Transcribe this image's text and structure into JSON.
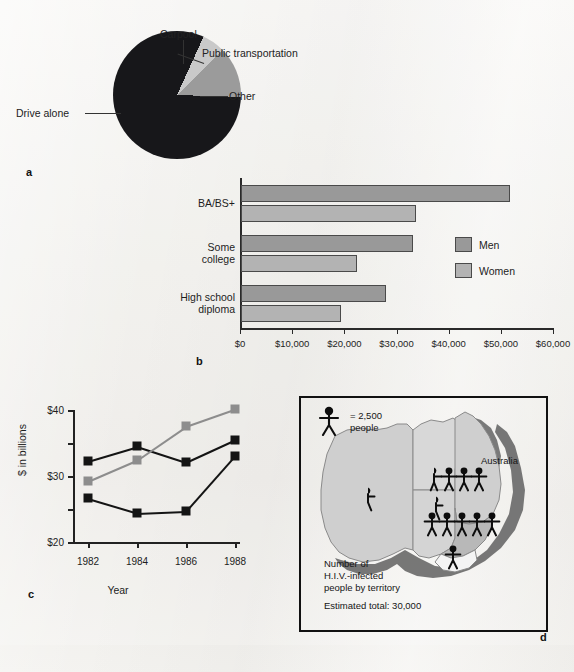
{
  "figure": {
    "background_color": "#f0efec",
    "panels": [
      "a",
      "b",
      "c",
      "d"
    ]
  },
  "panel_a": {
    "letter": "a",
    "labels": {
      "drive_alone": "Drive alone",
      "carpool": "Carpool",
      "public_transportation": "Public transportation",
      "other": "Other"
    }
  },
  "panel_b": {
    "letter": "b",
    "legend": {
      "men": "Men",
      "women": "Women"
    }
  },
  "panel_c": {
    "letter": "c",
    "ylabel": "$ in billions",
    "xlabel": "Year"
  },
  "panel_d": {
    "letter": "d",
    "key_symbol_value": "= 2,500",
    "key_symbol_unit": "people",
    "country": "Australia",
    "caption_line1": "Number of",
    "caption_line2": "H.I.V.-infected",
    "caption_line3": "people by territory",
    "total": "Estimated total: 30,000",
    "territory_counts": [
      {
        "territory": "Western Australia",
        "figures": 0.5,
        "people": 1250
      },
      {
        "territory": "South Australia",
        "figures": 0.5,
        "people": 1250
      },
      {
        "territory": "Queensland",
        "figures": 3.5,
        "people": 8750
      },
      {
        "territory": "New South Wales",
        "figures": 5,
        "people": 12500
      },
      {
        "territory": "Victoria",
        "figures": 1,
        "people": 2500
      }
    ]
  },
  "chart_data": [
    {
      "type": "pie",
      "title": "",
      "panel": "a",
      "labels": [
        "Drive alone",
        "Carpool",
        "Public transportation",
        "Other"
      ],
      "values": [
        73.3,
        6.7,
        5.6,
        12.8
      ],
      "unit": "percent",
      "colors": [
        "#17171a",
        "#17171a",
        "#c9c9c9",
        "#9b9b9b"
      ],
      "legend": "callout-labels"
    },
    {
      "type": "bar",
      "panel": "b",
      "orientation": "horizontal",
      "categories": [
        "BA/BS+",
        "Some college",
        "High school diploma"
      ],
      "series": [
        {
          "name": "Men",
          "values": [
            51500,
            33000,
            27800
          ],
          "color": "#999999"
        },
        {
          "name": "Women",
          "values": [
            33500,
            22300,
            19200
          ],
          "color": "#b3b3b3"
        }
      ],
      "xlabel": "",
      "ylabel": "",
      "xlim": [
        0,
        60000
      ],
      "xticks": [
        0,
        10000,
        20000,
        30000,
        40000,
        50000,
        60000
      ],
      "xticklabels": [
        "$0",
        "$10,000",
        "$20,000",
        "$30,000",
        "$40,000",
        "$50,000",
        "$60,000"
      ],
      "grid": false,
      "legend_position": "right"
    },
    {
      "type": "line",
      "panel": "c",
      "x": [
        1982,
        1984,
        1986,
        1988
      ],
      "xticklabels": [
        "1982",
        "1984",
        "1986",
        "1988"
      ],
      "series": [
        {
          "name": "series-1",
          "values": [
            32.3,
            34.5,
            32.1,
            35.5
          ],
          "color": "#141414",
          "marker": "square"
        },
        {
          "name": "series-2",
          "values": [
            29.3,
            32.5,
            37.6,
            40.2
          ],
          "color": "#8d8d8d",
          "marker": "square"
        },
        {
          "name": "series-3",
          "values": [
            26.6,
            24.4,
            24.7,
            33.1
          ],
          "color": "#141414",
          "marker": "square"
        }
      ],
      "xlabel": "Year",
      "ylabel": "$ in billions",
      "ylim": [
        20,
        40
      ],
      "yticks": [
        20,
        25,
        30,
        35,
        40
      ],
      "yticklabels": [
        "$20",
        "",
        "$30",
        "",
        "$40"
      ],
      "grid": false
    },
    {
      "type": "map",
      "panel": "d",
      "region": "Australia",
      "unit_per_symbol": 2500,
      "categories": [
        "Western Australia",
        "South Australia",
        "Queensland",
        "New South Wales",
        "Victoria"
      ],
      "values": [
        1250,
        1250,
        8750,
        12500,
        2500
      ],
      "total": 30000,
      "title": "Number of H.I.V.-infected people by territory"
    }
  ]
}
